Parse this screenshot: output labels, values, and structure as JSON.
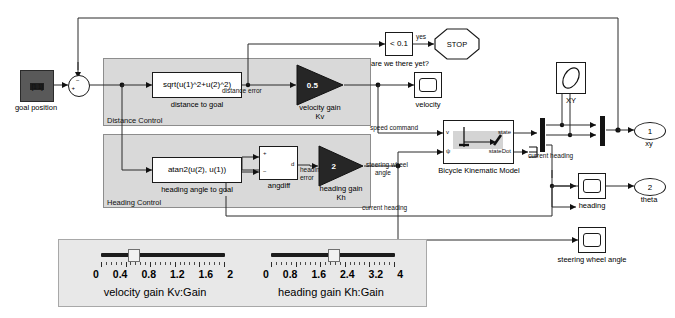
{
  "diagram": {
    "background": "#ffffff",
    "subsystem_fill": "#d9d9d9",
    "gain_fill": "#262626"
  },
  "source": {
    "goal_constant_label": "[1 1]",
    "goal_caption": "goal position",
    "sum_plus": "+",
    "sum_minus": "−"
  },
  "distance_control": {
    "subsystem_name": "Distance Control",
    "fcn_block": "sqrt(u(1)^2+u(2)^2)",
    "fcn_caption": "distance to goal",
    "signal_distance_error": "distance error",
    "gain_value": "0.5",
    "gain_caption_line1": "velocity gain",
    "gain_caption_line2": "Kv"
  },
  "heading_control": {
    "subsystem_name": "Heading Control",
    "fcn_block": "atan2(u(2), u(1))",
    "fcn_caption": "heading angle to goal",
    "angdiff_caption": "angdiff",
    "angdiff_plus": "+",
    "angdiff_minus": "−",
    "angdiff_out": "d",
    "signal_heading_error_l1": "heading",
    "signal_heading_error_l2": "error",
    "gain_value": "2",
    "gain_caption_line1": "heading gain",
    "gain_caption_line2": "Kh",
    "signal_steering_l1": "steering wheel",
    "signal_steering_l2": "angle"
  },
  "stop_logic": {
    "compare_block": "< 0.1",
    "compare_caption": "are we there yet?",
    "yes_label": "yes",
    "stop_label": "STOP"
  },
  "plant": {
    "block_caption": "Bicycle Kinematic Model",
    "in_port_1": "v",
    "in_port_2": "ψ",
    "out_port_1": "state",
    "out_port_2": "stateDot",
    "signal_speed_command": "speed command",
    "signal_current_heading_1": "current heading",
    "signal_current_heading_2": "current heading"
  },
  "scopes": {
    "velocity": "velocity",
    "xy": "XY",
    "heading": "heading",
    "steering_wheel_angle": "steering wheel angle"
  },
  "outports": [
    {
      "number": "1",
      "label": "xy"
    },
    {
      "number": "2",
      "label": "theta"
    }
  ],
  "sliders": [
    {
      "name": "velocity-gain",
      "label": "velocity gain Kv:Gain",
      "min": 0,
      "max": 2,
      "value": 0.5,
      "ticks": [
        "0",
        "0.4",
        "0.8",
        "1.2",
        "1.6",
        "2"
      ]
    },
    {
      "name": "heading-gain",
      "label": "heading gain Kh:Gain",
      "min": 0,
      "max": 4,
      "value": 2,
      "ticks": [
        "0",
        "0.8",
        "1.6",
        "2.4",
        "3.2",
        "4"
      ]
    }
  ]
}
